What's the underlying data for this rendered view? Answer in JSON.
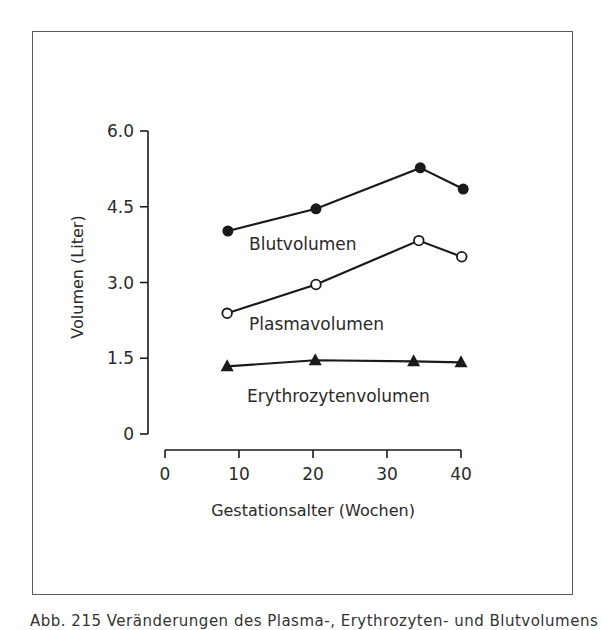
{
  "figure": {
    "caption": "Abb. 215 Veränderungen des Plasma-, Erythrozyten- und Blutvolumens"
  },
  "chart_data": {
    "type": "line",
    "title": "",
    "xlabel": "Gestationsalter (Wochen)",
    "ylabel": "Volumen (Liter)",
    "xlim": [
      0,
      40
    ],
    "ylim": [
      0,
      6.0
    ],
    "x_ticks": [
      "0",
      "10",
      "20",
      "30",
      "40"
    ],
    "y_ticks": [
      "0",
      "1.5",
      "3.0",
      "4.5",
      "6.0"
    ],
    "grid": false,
    "legend": "inline labels below each line",
    "series": [
      {
        "name": "Blutvolumen",
        "marker": "filled-circle",
        "x": [
          8.5,
          20.4,
          34.5,
          40.3
        ],
        "values": [
          4.02,
          4.46,
          5.27,
          4.85
        ]
      },
      {
        "name": "Plasmavolumen",
        "marker": "open-circle",
        "x": [
          8.4,
          20.4,
          34.3,
          40.1
        ],
        "values": [
          2.39,
          2.96,
          3.83,
          3.51
        ]
      },
      {
        "name": "Erythrozytenvolumen",
        "marker": "filled-triangle",
        "x": [
          8.4,
          20.3,
          33.6,
          40.0
        ],
        "values": [
          1.34,
          1.46,
          1.44,
          1.42
        ]
      }
    ]
  }
}
